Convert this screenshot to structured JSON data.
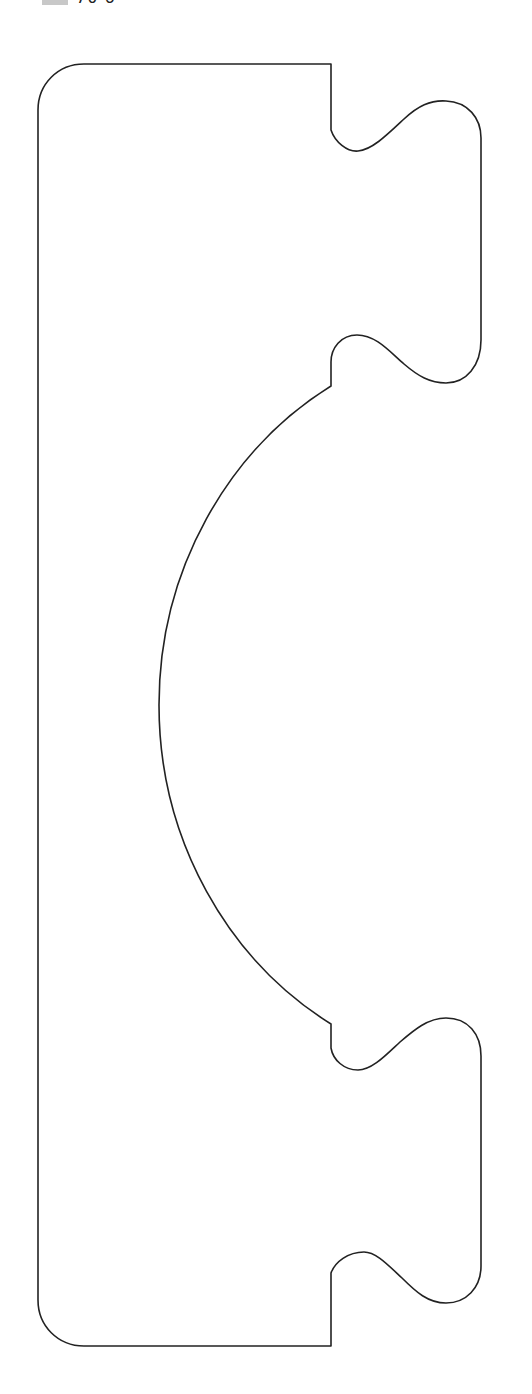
{
  "caption": {
    "swatch_color": "#c8c8c8",
    "text": "70·6 ·"
  },
  "diagram": {
    "type": "die-cut outline",
    "stroke_color": "#222222",
    "fill_color": "#ffffff",
    "canvas": {
      "width": 532,
      "height": 1394
    }
  }
}
